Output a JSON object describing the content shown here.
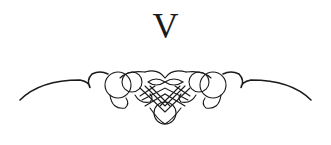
{
  "heading": {
    "numeral": "V"
  },
  "ornament": {
    "name": "calligraphic-flourish",
    "color": "#1a1a1a"
  }
}
